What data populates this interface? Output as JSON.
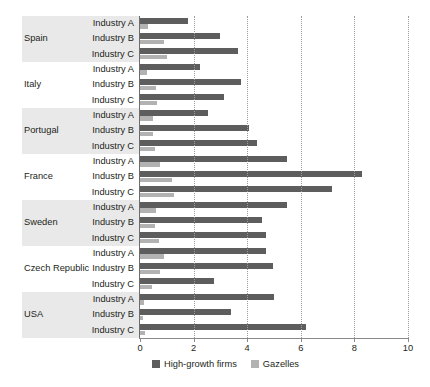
{
  "chart_data": {
    "type": "bar",
    "orientation": "horizontal",
    "title": "",
    "xlabel": "",
    "ylabel": "",
    "xlim": [
      0,
      10
    ],
    "xticks": [
      0,
      2,
      4,
      6,
      8,
      10
    ],
    "xtick_labels": [
      "0",
      "2",
      "4",
      "6",
      "8",
      "10"
    ],
    "grid": true,
    "grid_axis": "x",
    "legend_position": "bottom",
    "legend": [
      "High-growth firms",
      "Gazelles"
    ],
    "series": [
      {
        "name": "High-growth firms",
        "color": "#5d5d5d",
        "values": [
          1.8,
          3.0,
          3.65,
          2.25,
          3.75,
          3.15,
          2.55,
          4.05,
          4.35,
          5.5,
          8.3,
          7.15,
          5.5,
          4.55,
          4.7,
          4.7,
          4.95,
          2.75,
          5.0,
          3.4,
          6.2
        ]
      },
      {
        "name": "Gazelles",
        "color": "#b2b2b2",
        "values": [
          0.3,
          0.9,
          1.0,
          0.25,
          0.6,
          0.65,
          0.5,
          0.5,
          0.55,
          0.75,
          1.2,
          1.25,
          0.6,
          0.55,
          0.7,
          0.9,
          0.75,
          0.45,
          0.15,
          0.1,
          0.2
        ]
      }
    ],
    "categories": [
      "Spain - Industry A",
      "Spain - Industry B",
      "Spain - Industry C",
      "Italy - Industry A",
      "Italy - Industry B",
      "Italy - Industry C",
      "Portugal - Industry A",
      "Portugal - Industry B",
      "Portugal - Industry C",
      "France - Industry A",
      "France - Industry B",
      "France - Industry C",
      "Sweden - Industry A",
      "Sweden - Industry B",
      "Sweden - Industry C",
      "Czech Republic - Industry A",
      "Czech Republic - Industry B",
      "Czech Republic - Industry C",
      "USA - Industry A",
      "USA - Industry B",
      "USA - Industry C"
    ],
    "groups": [
      {
        "country": "Spain",
        "shaded": true,
        "rows": [
          {
            "industry": "Industry A",
            "high_growth_firms": 1.8,
            "gazelles": 0.3
          },
          {
            "industry": "Industry B",
            "high_growth_firms": 3.0,
            "gazelles": 0.9
          },
          {
            "industry": "Industry C",
            "high_growth_firms": 3.65,
            "gazelles": 1.0
          }
        ]
      },
      {
        "country": "Italy",
        "shaded": false,
        "rows": [
          {
            "industry": "Industry A",
            "high_growth_firms": 2.25,
            "gazelles": 0.25
          },
          {
            "industry": "Industry B",
            "high_growth_firms": 3.75,
            "gazelles": 0.6
          },
          {
            "industry": "Industry C",
            "high_growth_firms": 3.15,
            "gazelles": 0.65
          }
        ]
      },
      {
        "country": "Portugal",
        "shaded": true,
        "rows": [
          {
            "industry": "Industry A",
            "high_growth_firms": 2.55,
            "gazelles": 0.5
          },
          {
            "industry": "Industry B",
            "high_growth_firms": 4.05,
            "gazelles": 0.5
          },
          {
            "industry": "Industry C",
            "high_growth_firms": 4.35,
            "gazelles": 0.55
          }
        ]
      },
      {
        "country": "France",
        "shaded": false,
        "rows": [
          {
            "industry": "Industry A",
            "high_growth_firms": 5.5,
            "gazelles": 0.75
          },
          {
            "industry": "Industry B",
            "high_growth_firms": 8.3,
            "gazelles": 1.2
          },
          {
            "industry": "Industry C",
            "high_growth_firms": 7.15,
            "gazelles": 1.25
          }
        ]
      },
      {
        "country": "Sweden",
        "shaded": true,
        "rows": [
          {
            "industry": "Industry A",
            "high_growth_firms": 5.5,
            "gazelles": 0.6
          },
          {
            "industry": "Industry B",
            "high_growth_firms": 4.55,
            "gazelles": 0.55
          },
          {
            "industry": "Industry C",
            "high_growth_firms": 4.7,
            "gazelles": 0.7
          }
        ]
      },
      {
        "country": "Czech Republic",
        "shaded": false,
        "rows": [
          {
            "industry": "Industry A",
            "high_growth_firms": 4.7,
            "gazelles": 0.9
          },
          {
            "industry": "Industry B",
            "high_growth_firms": 4.95,
            "gazelles": 0.75
          },
          {
            "industry": "Industry C",
            "high_growth_firms": 2.75,
            "gazelles": 0.45
          }
        ]
      },
      {
        "country": "USA",
        "shaded": true,
        "rows": [
          {
            "industry": "Industry A",
            "high_growth_firms": 5.0,
            "gazelles": 0.15
          },
          {
            "industry": "Industry B",
            "high_growth_firms": 3.4,
            "gazelles": 0.1
          },
          {
            "industry": "Industry C",
            "high_growth_firms": 6.2,
            "gazelles": 0.2
          }
        ]
      }
    ]
  }
}
